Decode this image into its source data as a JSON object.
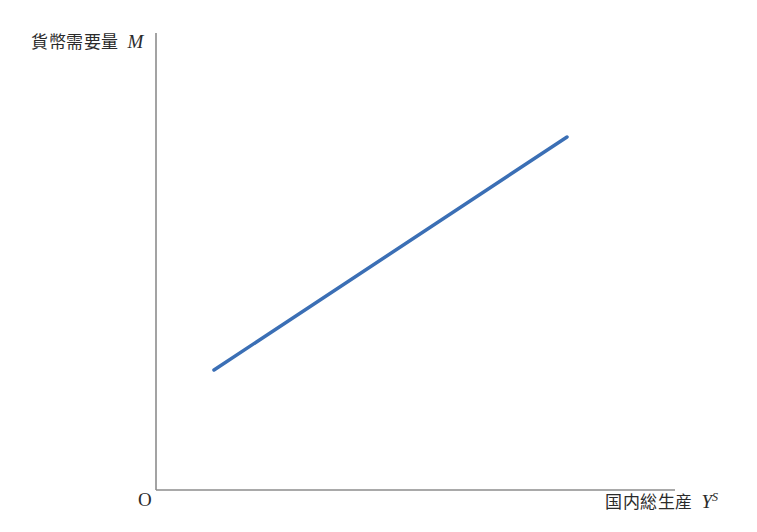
{
  "figure": {
    "width": 757,
    "height": 532,
    "background_color": "#ffffff"
  },
  "chart_data": {
    "type": "line",
    "title": "",
    "subtitle": "",
    "xlabel_text": "国内総生産",
    "xlabel_symbol": "Y",
    "xlabel_symbol_superscript": "S",
    "ylabel_text": "貨幣需要量",
    "ylabel_symbol": "M",
    "origin_label": "O",
    "grid": false,
    "legend": null,
    "axis_color": "#8c8c8c",
    "axis_linewidth": 1.6,
    "xlim": [
      0,
      1
    ],
    "ylim": [
      0,
      1
    ],
    "xticks": [],
    "yticks": [],
    "xticklabels": [],
    "yticklabels": [],
    "annotations": [],
    "series": [
      {
        "name": "money-demand-curve",
        "color": "#3b6fb5",
        "linewidth": 3.5,
        "x": [
          0.112,
          0.793
        ],
        "y": [
          0.263,
          0.772
        ],
        "pixel_points": [
          [
            214,
            370
          ],
          [
            567,
            137
          ]
        ]
      }
    ]
  },
  "axes": {
    "y_axis": {
      "x": 156,
      "y_top": 33,
      "y_bottom": 490
    },
    "x_axis": {
      "y": 490,
      "x_left": 156,
      "x_right": 675
    }
  }
}
